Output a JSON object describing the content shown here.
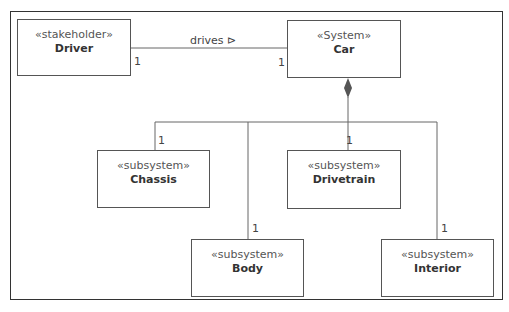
{
  "diagram": {
    "blocks": [
      {
        "id": "driver",
        "stereotype": "«stakeholder»",
        "name": "Driver"
      },
      {
        "id": "car",
        "stereotype": "«System»",
        "name": "Car"
      },
      {
        "id": "chassis",
        "stereotype": "«subsystem»",
        "name": "Chassis"
      },
      {
        "id": "drivetrain",
        "stereotype": "«subsystem»",
        "name": "Drivetrain"
      },
      {
        "id": "body",
        "stereotype": "«subsystem»",
        "name": "Body"
      },
      {
        "id": "interior",
        "stereotype": "«subsystem»",
        "name": "Interior"
      }
    ],
    "association": {
      "label": "drives ⊳",
      "mult_driver": "1",
      "mult_car": "1"
    },
    "composition": {
      "mult_chassis": "1",
      "mult_drivetrain": "1",
      "mult_body": "1",
      "mult_interior": "1"
    }
  }
}
